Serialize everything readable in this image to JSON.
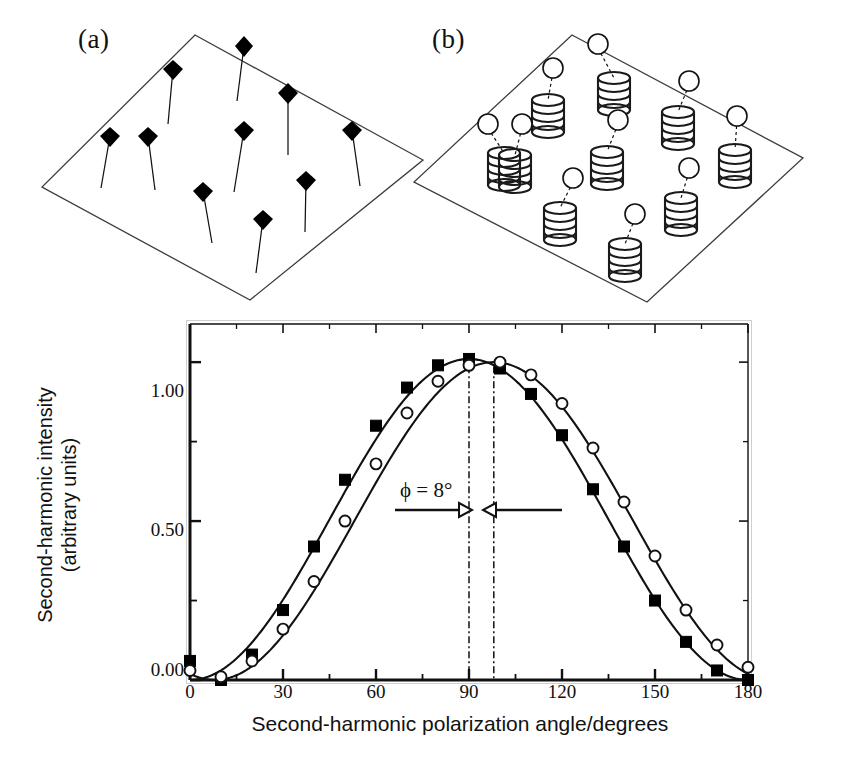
{
  "figure": {
    "panels": [
      {
        "id": "a",
        "label": "(a)",
        "description": "tilted plane with oriented rod-like chromophores drawn as filled diamond heads on thin stems",
        "marker_shape": "filled-diamond",
        "marker_color": "#000000",
        "plane_edge_color": "#3a3a3a"
      },
      {
        "id": "b",
        "label": "(b)",
        "description": "tilted plane with alpha-helical coils each linked by a dashed tether to an open circle chromophore",
        "marker_shape": "open-circle",
        "marker_color": "#ffffff",
        "coil_color": "#1a1a1a",
        "plane_edge_color": "#3a3a3a"
      }
    ]
  },
  "chart_data": {
    "type": "line",
    "title": "",
    "xlabel": "Second-harmonic polarization angle/degrees",
    "ylabel": "Second-harmonic intensity\n(arbitrary units)",
    "ylabel_line1": "Second-harmonic intensity",
    "ylabel_line2": "(arbitrary units)",
    "xlim": [
      0,
      180
    ],
    "ylim": [
      0.0,
      1.12
    ],
    "xticks": [
      0,
      30,
      60,
      90,
      120,
      150,
      180
    ],
    "xtick_labels": [
      "0",
      "30",
      "60",
      "90",
      "120",
      "150",
      "180"
    ],
    "xminor_ticks": [
      15,
      45,
      75,
      105,
      135,
      165
    ],
    "yticks": [
      0.0,
      0.5,
      1.0
    ],
    "ytick_labels": [
      "0.00",
      "0.50",
      "1.00"
    ],
    "yminor_ticks": [
      0.25,
      0.75
    ],
    "grid": false,
    "legend": "none",
    "annotations": [
      {
        "name": "phase-shift-annotation",
        "text": "ϕ = 8°",
        "x": 62,
        "y": 0.62,
        "arrow_from": 38,
        "arrow_to": 90,
        "arrow2_from": 148,
        "arrow2_to": 98
      }
    ],
    "guide_lines": [
      {
        "name": "peak-guide-squares",
        "x": 90,
        "style": "dash-dot"
      },
      {
        "name": "peak-guide-circles",
        "x": 98,
        "style": "dash-dot"
      }
    ],
    "x": [
      0,
      10,
      20,
      30,
      40,
      50,
      60,
      70,
      80,
      90,
      100,
      110,
      120,
      130,
      140,
      150,
      160,
      170,
      180
    ],
    "series": [
      {
        "name": "filled-squares",
        "marker": "filled-square",
        "peak_angle": 90,
        "values": [
          0.06,
          0.0,
          0.08,
          0.22,
          0.42,
          0.63,
          0.8,
          0.92,
          0.99,
          1.01,
          0.98,
          0.9,
          0.77,
          0.6,
          0.42,
          0.25,
          0.12,
          0.03,
          0.0
        ]
      },
      {
        "name": "open-circles",
        "marker": "open-circle",
        "peak_angle": 98,
        "values": [
          0.03,
          0.01,
          0.06,
          0.16,
          0.31,
          0.5,
          0.68,
          0.84,
          0.94,
          0.99,
          1.0,
          0.96,
          0.87,
          0.73,
          0.56,
          0.39,
          0.22,
          0.11,
          0.04
        ]
      }
    ]
  }
}
